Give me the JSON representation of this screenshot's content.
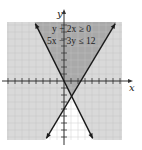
{
  "chart_data": {
    "type": "inequality-graph",
    "title": "",
    "inequalities": [
      "y + 2x ≥ 0",
      "5x − 3y ≤ 12"
    ],
    "lines": [
      {
        "equation": "y = -2x",
        "boundary": "y + 2x = 0",
        "style": "solid",
        "arrows": true
      },
      {
        "equation": "y = (5x - 12)/3",
        "boundary": "5x - 3y = 12",
        "style": "solid",
        "arrows": true
      }
    ],
    "intersection": [
      1.09,
      -2.18
    ],
    "xlabel": "x",
    "ylabel": "y",
    "xlim": [
      -8,
      8
    ],
    "ylim": [
      -8.5,
      8.5
    ],
    "grid": true,
    "shading": {
      "darker_region": "solution set (both inequalities satisfied, above both lines)",
      "light_region": "satisfies one inequality",
      "white_region": "satisfies neither (below both lines)"
    },
    "colors": {
      "solution": "#a9a9a9",
      "single": "#d9d9d9",
      "none": "#ffffff",
      "grid": "#c4c4c4",
      "axes": "#333333"
    }
  },
  "labels": {
    "x_axis": "x",
    "y_axis": "y",
    "ineq1": "y + 2x ≥ 0",
    "ineq2": "5x − 3y ≤ 12"
  }
}
